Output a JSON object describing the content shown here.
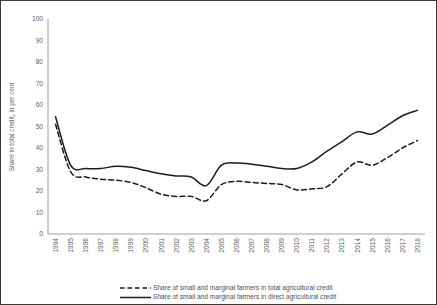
{
  "chart_data": {
    "type": "line",
    "title": "",
    "xlabel": "",
    "ylabel": "Share in total credit, in per cent",
    "ylim": [
      0,
      100
    ],
    "ytick_step": 10,
    "yticks": [
      0,
      10,
      20,
      30,
      40,
      50,
      60,
      70,
      80,
      90,
      100
    ],
    "grid": false,
    "legend_position": "bottom",
    "categories": [
      "1994",
      "1995",
      "1996",
      "1997",
      "1998",
      "1999",
      "2000",
      "2001",
      "2002",
      "2003",
      "2004",
      "2005",
      "2006",
      "2007",
      "2008",
      "2009",
      "2010",
      "2011",
      "2012",
      "2013",
      "2014",
      "2015",
      "2016",
      "2017",
      "2018"
    ],
    "series": [
      {
        "name": "Share of small and marginal farmers in total agricultural credit",
        "style": "dashed",
        "color": "#1c1c1c",
        "values": [
          51.0,
          29.0,
          26.5,
          25.5,
          25.0,
          24.0,
          21.5,
          18.5,
          17.5,
          17.5,
          15.5,
          23.0,
          24.5,
          24.0,
          23.5,
          23.0,
          20.5,
          21.0,
          22.0,
          28.0,
          33.5,
          32.0,
          35.5,
          40.0,
          43.5
        ]
      },
      {
        "name": "Share of small and marginal farmers in direct agricultural credit",
        "style": "solid",
        "color": "#1c1c1c",
        "values": [
          54.5,
          32.0,
          30.5,
          30.5,
          31.5,
          31.0,
          29.5,
          28.0,
          27.0,
          26.5,
          22.5,
          32.0,
          33.0,
          32.5,
          31.5,
          30.5,
          30.5,
          33.5,
          38.5,
          43.0,
          47.5,
          46.5,
          50.5,
          55.0,
          57.5
        ]
      }
    ]
  },
  "legend": {
    "items": [
      {
        "label": "Share of small and marginal farmers in total agricultural credit",
        "style": "dashed"
      },
      {
        "label": "Share of small and marginal farmers in direct agricultural credit",
        "style": "solid"
      }
    ]
  }
}
